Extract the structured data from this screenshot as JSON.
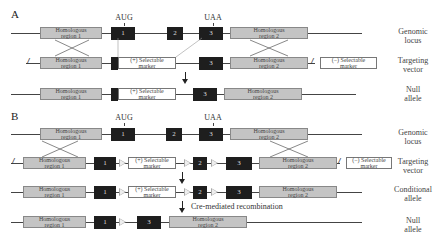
{
  "panels": {
    "a": {
      "label": "A",
      "codons": {
        "start": "AUG",
        "stop": "UAA"
      },
      "rows": [
        {
          "name": "Genomic locus",
          "side_label": [
            "Genomic",
            "locus"
          ]
        },
        {
          "name": "Targeting vector",
          "side_label": [
            "Targeting",
            "vector"
          ]
        },
        {
          "name": "Null allele",
          "side_label": [
            "Null",
            "allele"
          ]
        }
      ]
    },
    "b": {
      "label": "B",
      "codons": {
        "start": "AUG",
        "stop": "UAA"
      },
      "rows": [
        {
          "name": "Genomic locus",
          "side_label": [
            "Genomic",
            "locus"
          ]
        },
        {
          "name": "Targeting vector",
          "side_label": [
            "Targeting",
            "vector"
          ]
        },
        {
          "name": "Conditional allele",
          "side_label": [
            "Conditional",
            "allele"
          ]
        },
        {
          "name": "Null allele",
          "side_label": [
            "Null",
            "allele"
          ]
        }
      ],
      "recombination_note": "Cre-mediated recombination"
    }
  },
  "elements": {
    "hom1": [
      "Homologous",
      "region 1"
    ],
    "hom2": [
      "Homologous",
      "region 2"
    ],
    "pos_marker": [
      "(+) Selectable",
      "marker"
    ],
    "neg_marker": [
      "(−) Selectable",
      "marker"
    ],
    "exon1": "1",
    "exon2": "2",
    "exon3": "3",
    "break_mark": "//"
  },
  "colors": {
    "exon": "#1e1e1e",
    "homologous_region": "#c4c4c4",
    "marker": "#ffffff",
    "loxp_site": "#aaaaaa"
  }
}
